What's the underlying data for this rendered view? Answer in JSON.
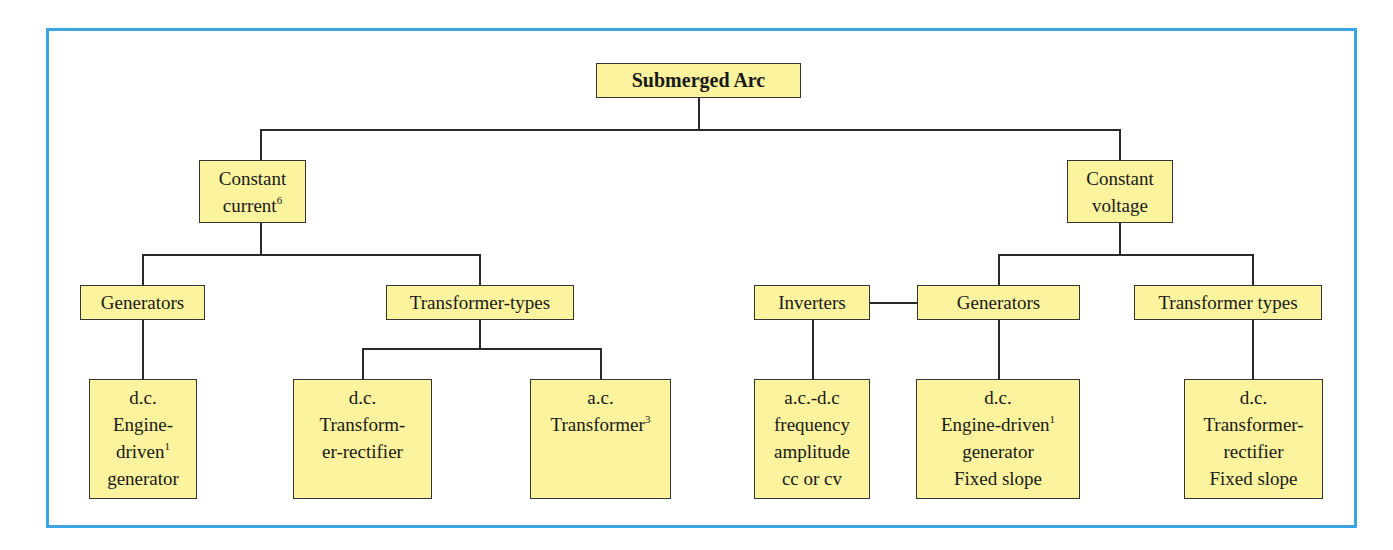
{
  "diagram": {
    "root": {
      "label": "Submerged Arc"
    },
    "constant_current": {
      "line1": "Constant",
      "line2": "current",
      "sup": "6",
      "generators": {
        "label": "Generators",
        "leaf": {
          "line1": "d.c.",
          "line2": "Engine-",
          "line3": "driven",
          "sup": "1",
          "line4": "generator"
        }
      },
      "transformer_types": {
        "label": "Transformer-types",
        "leaf_dc": {
          "line1": "d.c.",
          "line2": "Transform-",
          "line3": "er-rectifier"
        },
        "leaf_ac": {
          "line1": "a.c.",
          "line2": "Transformer",
          "sup": "3"
        }
      }
    },
    "constant_voltage": {
      "line1": "Constant",
      "line2": "voltage",
      "inverters": {
        "label": "Inverters",
        "leaf": {
          "line1": "a.c.-d.c",
          "line2": "frequency",
          "line3": "amplitude",
          "line4": "cc or cv"
        }
      },
      "generators": {
        "label": "Generators",
        "leaf": {
          "line1": "d.c.",
          "line2": "Engine-driven",
          "sup": "1",
          "line3": "generator",
          "line4": "Fixed slope"
        }
      },
      "transformer_types": {
        "label": "Transformer types",
        "leaf": {
          "line1": "d.c.",
          "line2": "Transformer-",
          "line3": "rectifier",
          "line4": "Fixed slope"
        }
      }
    }
  },
  "colors": {
    "frame": "#3aa5e0",
    "box_fill": "#fbf39d",
    "line": "#2a2a2a"
  }
}
